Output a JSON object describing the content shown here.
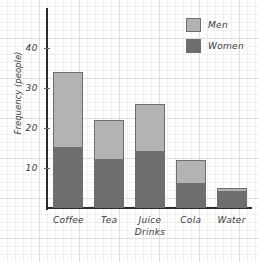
{
  "chart_data": {
    "type": "bar",
    "stacked": true,
    "title": "",
    "xlabel": "",
    "ylabel": "Frequency (people)",
    "categories": [
      "Coffee",
      "Tea",
      "Juice Drinks",
      "Cola",
      "Water"
    ],
    "category_lines": [
      [
        "Coffee"
      ],
      [
        "Tea"
      ],
      [
        "Juice",
        "Drinks"
      ],
      [
        "Cola"
      ],
      [
        "Water"
      ]
    ],
    "series": [
      {
        "name": "Women",
        "color": "#6e6e6e",
        "values": [
          15,
          12,
          14,
          6,
          4
        ]
      },
      {
        "name": "Men",
        "color": "#b3b3b3",
        "values": [
          19,
          10,
          12,
          6,
          1
        ]
      }
    ],
    "totals": [
      34,
      22,
      26,
      12,
      5
    ],
    "ylim": [
      0,
      45
    ],
    "yticks": [
      10,
      20,
      30,
      40
    ],
    "ytick_labels": [
      "10",
      "20",
      "30",
      "40"
    ],
    "grid": true,
    "grid_style": "graph-paper",
    "legend_position": "top-right",
    "legend": [
      "Men",
      "Women"
    ]
  },
  "colors": {
    "men": "#b3b3b3",
    "women": "#6e6e6e",
    "axis": "#2b2b2b",
    "bar_border": "#6e6e6e",
    "grid_minor": "#f0f0f0",
    "grid_major": "#dedede",
    "text": "#3a3a3a",
    "background": "#ffffff"
  }
}
